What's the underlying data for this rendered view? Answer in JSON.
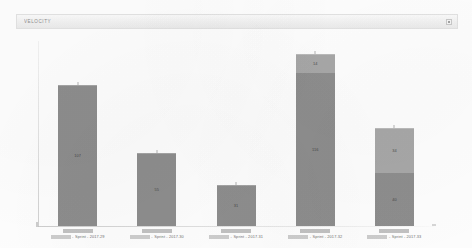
{
  "panel": {
    "title": "VELOCITY",
    "menu_icon": "hamburger-menu-icon"
  },
  "chart_data": {
    "type": "bar",
    "title": "VELOCITY",
    "xlabel": "",
    "ylabel": "",
    "grid": false,
    "legend": false,
    "stacked": true,
    "ylim": [
      0,
      140
    ],
    "categories": [
      "Sprint - 2017.29",
      "Sprint - 2017.30",
      "Sprint - 2017.31",
      "Sprint - 2017.32",
      "Sprint - 2017.33"
    ],
    "series": [
      {
        "name": "lower",
        "color": "#8e8e8e",
        "values": [
          107,
          55,
          31,
          116,
          40
        ]
      },
      {
        "name": "upper",
        "color": "#a8a8a8",
        "values": [
          0,
          0,
          0,
          14,
          34
        ]
      }
    ],
    "bars": [
      {
        "category": "Sprint - 2017.29",
        "redacted_prefix": true,
        "label": "Sprint - 2017.29",
        "total": 107,
        "segments": [
          {
            "series": "lower",
            "value": 107,
            "value_label": "107"
          }
        ]
      },
      {
        "category": "Sprint - 2017.30",
        "redacted_prefix": true,
        "label": "Sprint - 2017.30",
        "total": 55,
        "segments": [
          {
            "series": "lower",
            "value": 55,
            "value_label": "55"
          }
        ]
      },
      {
        "category": "Sprint - 2017.31",
        "redacted_prefix": true,
        "label": "Sprint - 2017.31",
        "total": 31,
        "segments": [
          {
            "series": "lower",
            "value": 31,
            "value_label": "31"
          }
        ]
      },
      {
        "category": "Sprint - 2017.32",
        "redacted_prefix": true,
        "label": "Sprint - 2017.32",
        "total": 130,
        "segments": [
          {
            "series": "upper",
            "value": 14,
            "value_label": "14"
          },
          {
            "series": "lower",
            "value": 116,
            "value_label": "116"
          }
        ]
      },
      {
        "category": "Sprint - 2017.33",
        "redacted_prefix": true,
        "label": "Sprint - 2017.33",
        "total": 74,
        "segments": [
          {
            "series": "upper",
            "value": 34,
            "value_label": "34"
          },
          {
            "series": "lower",
            "value": 40,
            "value_label": "40"
          }
        ]
      }
    ]
  }
}
